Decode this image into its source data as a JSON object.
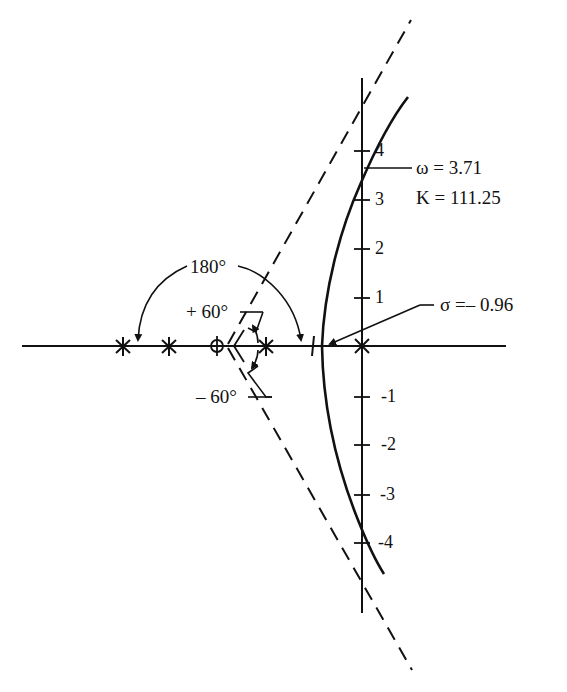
{
  "diagram": {
    "type": "root-locus",
    "axes": {
      "real_axis": {
        "x_start": 22,
        "x_end": 506,
        "y": 346
      },
      "imag_axis": {
        "x": 362,
        "y_start": 78,
        "y_end": 613
      },
      "imag_ticks": [
        {
          "value": 4,
          "label": "4",
          "y": 151
        },
        {
          "value": 3,
          "label": "3",
          "y": 200
        },
        {
          "value": 2,
          "label": "2",
          "y": 249
        },
        {
          "value": 1,
          "label": "1",
          "y": 298
        },
        {
          "value": -1,
          "label": "-1",
          "y": 397
        },
        {
          "value": -2,
          "label": "-2",
          "y": 445
        },
        {
          "value": -3,
          "label": "-3",
          "y": 495
        },
        {
          "value": -4,
          "label": "-4",
          "y": 543
        }
      ]
    },
    "poles": [
      {
        "symbol": "pole-star",
        "x": 123
      },
      {
        "symbol": "pole-star",
        "x": 169
      },
      {
        "symbol": "pole-star",
        "x": 266
      },
      {
        "symbol": "pole-cross",
        "x": 362
      }
    ],
    "zeros": [
      {
        "symbol": "zero-circle",
        "x": 217
      }
    ],
    "asymptote_angles": [
      "+60°",
      "-60°",
      "180°"
    ],
    "annotations": {
      "omega_crossing": "ω = 3.71",
      "gain_at_crossing": "K = 111.25",
      "breakaway": "σ =– 0.96",
      "angle_180": "180°",
      "angle_plus60": "+ 60°",
      "angle_minus60": "– 60°"
    },
    "colors": {
      "ink": "#111111",
      "background": "#ffffff"
    }
  }
}
